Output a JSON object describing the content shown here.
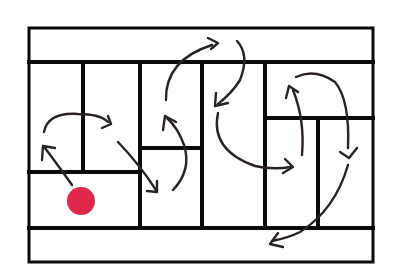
{
  "diagram": {
    "type": "floor-plan-path",
    "colors": {
      "walls": "#0a0a0a",
      "arrows": "#2a2220",
      "start_marker": "#e0264a",
      "background": "#ffffff"
    },
    "frame": {
      "x": 29,
      "y": 28,
      "width": 344,
      "height": 234
    },
    "walls": [
      {
        "id": "top-band-divider",
        "x1": 29,
        "y1": 62,
        "x2": 373,
        "y2": 62,
        "w": 4
      },
      {
        "id": "bottom-band-divider",
        "x1": 29,
        "y1": 228,
        "x2": 373,
        "y2": 228,
        "w": 4
      },
      {
        "id": "v-83",
        "x1": 83,
        "y1": 62,
        "x2": 83,
        "y2": 172,
        "w": 4
      },
      {
        "id": "v-140",
        "x1": 140,
        "y1": 62,
        "x2": 140,
        "y2": 228,
        "w": 4
      },
      {
        "id": "v-202",
        "x1": 202,
        "y1": 62,
        "x2": 202,
        "y2": 228,
        "w": 4
      },
      {
        "id": "v-265",
        "x1": 265,
        "y1": 62,
        "x2": 265,
        "y2": 228,
        "w": 4
      },
      {
        "id": "v-318",
        "x1": 318,
        "y1": 118,
        "x2": 318,
        "y2": 228,
        "w": 4
      },
      {
        "id": "h-172",
        "x1": 29,
        "y1": 172,
        "x2": 140,
        "y2": 172,
        "w": 4
      },
      {
        "id": "h-148",
        "x1": 140,
        "y1": 148,
        "x2": 202,
        "y2": 148,
        "w": 4
      },
      {
        "id": "h-118",
        "x1": 265,
        "y1": 118,
        "x2": 373,
        "y2": 118,
        "w": 4
      }
    ],
    "start_marker": {
      "cx": 81,
      "cy": 201,
      "r": 14
    },
    "path_steps": [
      {
        "step": 1,
        "d": "M 72 185 Q 60 168 45 148",
        "head": "M 42 160 L 43 146 L 55 148"
      },
      {
        "step": 2,
        "d": "M 44 132 Q 48 112 78 114 Q 100 114 108 122",
        "head": "M 102 128 L 111 124 L 108 116"
      },
      {
        "step": 3,
        "d": "M 118 142 Q 140 165 156 190",
        "head": "M 147 191 L 157 192 L 157 181"
      },
      {
        "step": 4,
        "d": "M 173 190 Q 192 170 184 145 Q 178 128 167 118",
        "head": "M 163 130 L 165 116 L 176 122"
      },
      {
        "step": 5,
        "d": "M 166 100 Q 165 60 212 45",
        "head": "M 208 38 L 218 43 L 211 49"
      },
      {
        "step": 6,
        "d": "M 237 41 Q 250 55 240 80 Q 232 93 218 104",
        "head": "M 216 93 L 215 106 L 228 103"
      },
      {
        "step": 7,
        "d": "M 218 113 Q 210 150 255 166 Q 272 170 291 167",
        "head": "M 285 159 L 293 167 L 283 173"
      },
      {
        "step": 8,
        "d": "M 302 155 Q 305 120 293 90",
        "head": "M 286 98 L 289 86 L 298 92"
      },
      {
        "step": 9,
        "d": "M 296 77 Q 315 68 335 82 Q 350 100 348 148",
        "head": "M 340 152 L 349 158 L 357 148"
      },
      {
        "step": 10,
        "d": "M 348 165 Q 335 210 300 232 Q 288 238 272 241",
        "head": "M 278 233 L 270 244 L 283 247"
      }
    ]
  }
}
